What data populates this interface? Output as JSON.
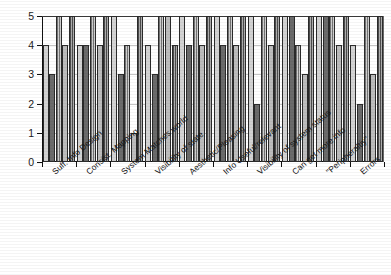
{
  "chart_data": {
    "type": "bar",
    "title": "",
    "subtitle": "",
    "xlabel": "",
    "ylabel": "",
    "ylim": [
      0,
      5
    ],
    "ytick_labels": [
      "0",
      "1",
      "2",
      "3",
      "4",
      "5"
    ],
    "ytick_values": [
      0,
      1,
      2,
      3,
      4,
      5
    ],
    "grid": false,
    "legend": "none",
    "orientation": "vertical",
    "grouping": "grouped",
    "categories": [
      "Suff. Info Design",
      "Consist. Mapping",
      "System Matches world",
      "Visibility of state",
      "Aesthetic/Pleasing",
      "Info Useful/relevant",
      "Visibility of system status",
      "Can get more info",
      "\"Peripheraltiy\"",
      "Errors"
    ],
    "series": [
      {
        "name": "R1",
        "fill": "fill-light",
        "values": [
          4,
          4,
          5,
          4,
          5,
          5,
          5,
          5,
          5,
          4
        ]
      },
      {
        "name": "R2",
        "fill": "fill-dark",
        "values": [
          3,
          4,
          3,
          3,
          4,
          4,
          2,
          5,
          5,
          2
        ]
      },
      {
        "name": "R3",
        "fill": "fill-hatch",
        "values": [
          5,
          5,
          4,
          5,
          5,
          5,
          5,
          4,
          5,
          5
        ]
      },
      {
        "name": "R4",
        "fill": "fill-mid",
        "values": [
          4,
          4,
          1,
          5,
          4,
          4,
          4,
          3,
          4,
          3
        ]
      },
      {
        "name": "R5",
        "fill": "fill-dense",
        "values": [
          5,
          5,
          5,
          4,
          5,
          5,
          5,
          5,
          5,
          5
        ]
      }
    ]
  }
}
